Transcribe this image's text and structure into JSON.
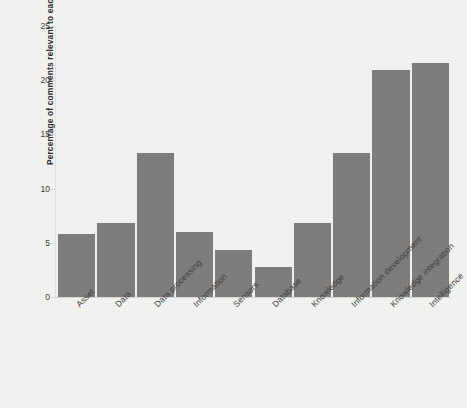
{
  "chart_data": {
    "type": "bar",
    "title": "",
    "xlabel": "",
    "ylabel": "Percentage of comments relevant to  each category",
    "categories": [
      "Asset",
      "Data",
      "Data processing",
      "Information",
      "Sensors",
      "Database",
      "Knowledge",
      "Information development",
      "Knowledge integration",
      "Intelligence"
    ],
    "values": [
      5.8,
      6.8,
      13.3,
      6.0,
      4.3,
      2.8,
      6.8,
      13.3,
      20.9,
      21.6
    ],
    "ylim": [
      0,
      25
    ],
    "yticks": [
      0,
      5,
      10,
      15,
      20,
      25
    ],
    "ytick_labels": [
      "0",
      "5",
      "10",
      "15",
      "20",
      "25"
    ],
    "grid": false,
    "legend": false,
    "bar_color": "#7c7c7c",
    "background_color": "#f4f4f2",
    "axis_color": "#e0e0de"
  }
}
